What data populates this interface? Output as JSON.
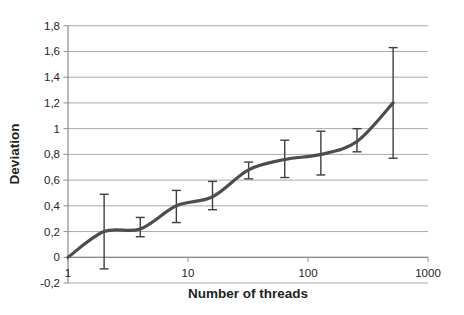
{
  "chart_data": {
    "type": "line",
    "title": "",
    "xlabel": "Number of threads",
    "ylabel": "Deviation",
    "x_scale": "log10",
    "xlim": [
      1,
      1000
    ],
    "ylim": [
      -0.2,
      1.8
    ],
    "grid": "horizontal",
    "legend": "none",
    "smoothed": true,
    "x_ticks": {
      "values": [
        1,
        10,
        100,
        1000
      ],
      "labels": [
        "1",
        "10",
        "100",
        "1000"
      ]
    },
    "y_ticks": {
      "values": [
        -0.2,
        0,
        0.2,
        0.4,
        0.6,
        0.8,
        1,
        1.2,
        1.4,
        1.6,
        1.8
      ],
      "labels": [
        "-0,2",
        "0",
        "0,2",
        "0,4",
        "0,6",
        "0,8",
        "1",
        "1,2",
        "1,4",
        "1,6",
        "1,8"
      ]
    },
    "series": [
      {
        "name": "Deviation",
        "x": [
          1,
          2,
          4,
          8,
          16,
          32,
          64,
          128,
          256,
          512
        ],
        "y": [
          0,
          0.2,
          0.22,
          0.4,
          0.47,
          0.68,
          0.76,
          0.8,
          0.9,
          1.2
        ],
        "error_low": [
          null,
          -0.09,
          0.16,
          0.27,
          0.37,
          0.61,
          0.62,
          0.64,
          0.82,
          0.77
        ],
        "error_high": [
          null,
          0.49,
          0.31,
          0.52,
          0.59,
          0.74,
          0.91,
          0.98,
          1.0,
          1.63
        ]
      }
    ],
    "colors": {
      "background": "#ffffff",
      "line": "#4d4d4d",
      "error_bar": "#3f3f3f",
      "gridline": "#a9a9a9",
      "axis": "#8c8c8c",
      "text": "#262626"
    }
  }
}
